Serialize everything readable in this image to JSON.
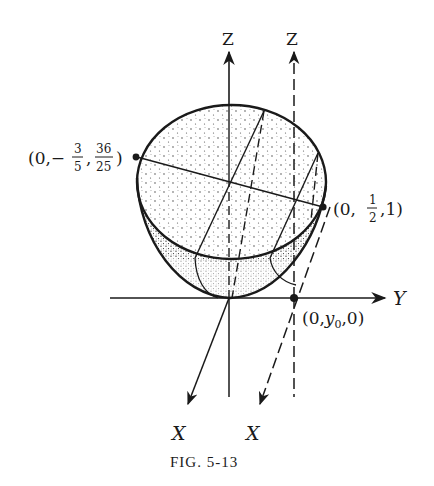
{
  "figure": {
    "caption": "FIG. 5-13",
    "axes": {
      "z_label": "Z",
      "z_shifted_label": "Z",
      "y_label": "Y",
      "x_label": "X",
      "x_shifted_label": "X"
    },
    "points": {
      "left_top": {
        "prefix": "(0,−",
        "frac1_num": "3",
        "frac1_den": "5",
        "sep": ",",
        "frac2_num": "36",
        "frac2_den": "25",
        "suffix": ")"
      },
      "right_top": {
        "prefix": "(0,",
        "frac_num": "1",
        "frac_den": "2",
        "suffix": ",1)"
      },
      "base": {
        "prefix": "(0,",
        "var": "y",
        "sub": "0",
        "suffix": ",0)"
      }
    },
    "colors": {
      "ink": "#1a1a1a",
      "background": "#ffffff"
    }
  }
}
